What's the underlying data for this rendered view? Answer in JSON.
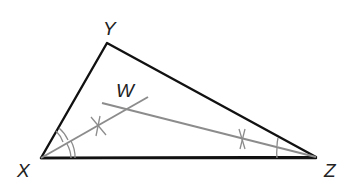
{
  "diagram": {
    "type": "triangle-angle-bisectors",
    "colors": {
      "sides": "#111111",
      "bisectors": "#8c8c8c",
      "labels": "#222222",
      "background": "#ffffff"
    },
    "vertices": {
      "X": {
        "label": "X"
      },
      "Y": {
        "label": "Y"
      },
      "Z": {
        "label": "Z"
      }
    },
    "points": {
      "W": {
        "label": "W"
      }
    },
    "segments": [
      "XY",
      "YZ",
      "XZ"
    ],
    "bisectors": [
      {
        "from": "X",
        "through": "W",
        "angle_marks": 2,
        "tick": "construction-cross"
      },
      {
        "from": "Z",
        "through": "W",
        "angle_marks": 1,
        "tick": "construction-cross"
      }
    ]
  }
}
